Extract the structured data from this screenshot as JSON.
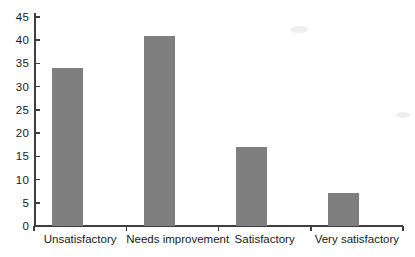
{
  "chart_data": {
    "type": "bar",
    "categories": [
      "Unsatisfactory",
      "Needs improvement",
      "Satisfactory",
      "Very satisfactory"
    ],
    "values": [
      34,
      41,
      17,
      7
    ],
    "title": "",
    "xlabel": "",
    "ylabel": "",
    "ylim": [
      0,
      45
    ],
    "yticks": [
      0,
      5,
      10,
      15,
      20,
      25,
      30,
      35,
      40,
      45
    ],
    "grid": false,
    "legend": "none",
    "bar_color": "#7f7f7f",
    "axis_color": "#3f3f3f",
    "text_color": "#1a1a1a",
    "background_color": "#ffffff"
  }
}
